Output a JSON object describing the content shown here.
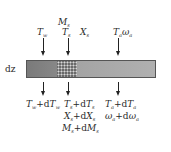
{
  "diagram": {
    "element_label": "dz",
    "inputs": {
      "wall": {
        "sym": "T",
        "sub": "w"
      },
      "solution_temp": {
        "sym": "T",
        "sub": "s"
      },
      "solution_mass": {
        "sym": "M",
        "sub": "s"
      },
      "solution_conc": {
        "sym": "X",
        "sub": "s"
      },
      "air_temp": {
        "sym": "T",
        "sub": "a"
      },
      "air_humidity": {
        "sym": "ω",
        "sub": "a"
      }
    },
    "outputs": {
      "wall": "T_w+dT_w",
      "solution": [
        "T_s+dT_s",
        "X_s+dX_s",
        "M_s+dM_s"
      ],
      "air": [
        "T_a+dT_a",
        "ω_a+dω_a"
      ]
    },
    "plus": "+",
    "d": "d"
  }
}
